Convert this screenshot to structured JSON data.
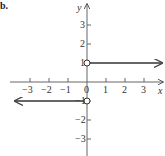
{
  "part_label": "b.",
  "chart_data": {
    "type": "line",
    "title": "",
    "xlabel": "x",
    "ylabel": "y",
    "xlim": [
      -3.9,
      4
    ],
    "ylim": [
      -3.9,
      4
    ],
    "x_ticks": [
      -3,
      -2,
      -1,
      0,
      1,
      2,
      3
    ],
    "x_tick_labels": [
      "−3",
      "−2",
      "−1",
      "0",
      "1",
      "2",
      "3"
    ],
    "y_ticks": [
      -3,
      -2,
      -1,
      1,
      2,
      3
    ],
    "y_tick_labels": [
      "−3",
      "−2",
      "−1",
      "1",
      "2",
      "3"
    ],
    "grid": false,
    "series": [
      {
        "name": "left piece",
        "x": [
          -3.9,
          0
        ],
        "y": [
          -1,
          -1
        ],
        "start": "arrow",
        "end": "open-circle"
      },
      {
        "name": "right piece",
        "x": [
          0,
          4
        ],
        "y": [
          1,
          1
        ],
        "start": "open-circle",
        "end": "arrow"
      }
    ]
  },
  "colors": {
    "axis": "#555555",
    "line": "#333333"
  }
}
